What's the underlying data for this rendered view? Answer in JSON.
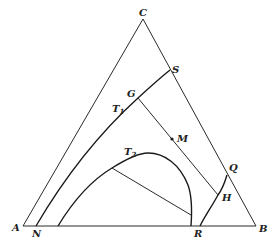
{
  "diagram": {
    "type": "ternary-phase-diagram",
    "vertices": {
      "A": "A",
      "B": "B",
      "C": "C"
    },
    "points": {
      "S": "S",
      "G": "G",
      "M": "M",
      "Q": "Q",
      "H": "H",
      "N": "N",
      "R": "R"
    },
    "curves": {
      "T1": {
        "label": "T",
        "subscript": "1"
      },
      "T2": {
        "label": "T",
        "subscript": "2"
      }
    },
    "colors": {
      "line": "#2a2a2a",
      "background": "#ffffff"
    }
  }
}
